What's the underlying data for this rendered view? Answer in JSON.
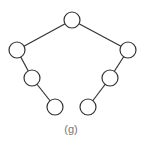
{
  "diagram": {
    "type": "binary-tree",
    "caption": "(g)",
    "caption_pos": {
      "x": 71,
      "y": 129
    },
    "node_radius": 8,
    "colors": {
      "stroke": "#333333",
      "fill": "#ffffff",
      "caption": "#777777"
    },
    "nodes": [
      {
        "id": "root",
        "x": 72,
        "y": 20
      },
      {
        "id": "l1",
        "x": 17,
        "y": 50
      },
      {
        "id": "r1",
        "x": 128,
        "y": 50
      },
      {
        "id": "l2",
        "x": 32,
        "y": 78
      },
      {
        "id": "r2",
        "x": 110,
        "y": 78
      },
      {
        "id": "l3",
        "x": 55,
        "y": 107
      },
      {
        "id": "r3",
        "x": 88,
        "y": 107
      }
    ],
    "edges": [
      [
        "root",
        "l1"
      ],
      [
        "root",
        "r1"
      ],
      [
        "l1",
        "l2"
      ],
      [
        "l2",
        "l3"
      ],
      [
        "r1",
        "r2"
      ],
      [
        "r2",
        "r3"
      ]
    ]
  }
}
